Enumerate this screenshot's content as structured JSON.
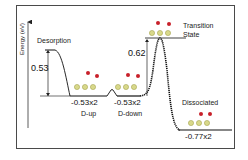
{
  "diagram": {
    "type": "energy-profile",
    "y_axis_label": "Energy (eV)",
    "stages": [
      {
        "id": "desorption",
        "label": "Desorption"
      },
      {
        "id": "d_up",
        "label": "D-up",
        "energy": "-0.53x2"
      },
      {
        "id": "d_down",
        "label": "D-down",
        "energy": "-0.53x2"
      },
      {
        "id": "transition_state",
        "label": "Transition State",
        "label_line1": "Transition",
        "label_line2": "State"
      },
      {
        "id": "dissociated",
        "label": "Dissociated",
        "energy": "-0.77x2"
      }
    ],
    "barriers": {
      "desorption": "0.53",
      "dissociation": "0.62"
    },
    "colors": {
      "surface_atom": "#d8d88a",
      "surface_atom_edge": "#9a9a40",
      "adsorbate_atom": "#c8202a",
      "line": "#111111",
      "frame": "#4a4a4a"
    }
  }
}
